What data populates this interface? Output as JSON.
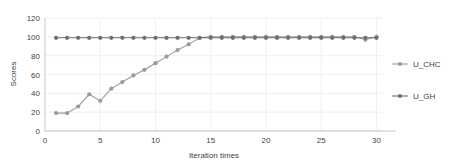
{
  "chart_data": {
    "type": "line",
    "title": "",
    "xlabel": "Iteration times",
    "ylabel": "Scores",
    "xlim": [
      0,
      30.5
    ],
    "ylim": [
      0,
      120
    ],
    "xticks": [
      0,
      5,
      10,
      15,
      20,
      25,
      30
    ],
    "yticks": [
      0,
      20,
      40,
      60,
      80,
      100,
      120
    ],
    "grid": true,
    "legend_position": "right",
    "x": [
      1,
      2,
      3,
      4,
      5,
      6,
      7,
      8,
      9,
      10,
      11,
      12,
      13,
      14,
      15,
      16,
      17,
      18,
      19,
      20,
      21,
      22,
      23,
      24,
      25,
      26,
      27,
      28,
      29,
      30
    ],
    "series": [
      {
        "name": "U_CHC",
        "color": "#9a9a9a",
        "marker": "circle",
        "values": [
          19,
          19,
          26,
          39,
          32,
          45,
          52,
          59,
          65,
          72,
          79,
          86,
          92,
          99,
          100,
          100,
          100,
          100,
          100,
          100,
          100,
          100,
          100,
          100,
          100,
          100,
          100,
          100,
          97,
          100
        ]
      },
      {
        "name": "U_GH",
        "color": "#6e6e6e",
        "marker": "circle",
        "values": [
          99,
          99,
          99,
          99,
          99,
          99,
          99,
          99,
          99,
          99,
          99,
          99,
          99,
          99,
          99,
          99,
          99,
          99,
          99,
          99,
          99,
          99,
          99,
          99,
          99,
          99,
          99,
          99,
          99,
          99
        ]
      }
    ]
  },
  "legend": {
    "items": [
      {
        "label": "U_CHC"
      },
      {
        "label": "U_GH"
      }
    ]
  },
  "axes": {
    "y_label": "Scores",
    "x_label": "Iteration times",
    "y_tick_labels": [
      "0",
      "20",
      "40",
      "60",
      "80",
      "100",
      "120"
    ],
    "x_tick_labels": [
      "0",
      "5",
      "10",
      "15",
      "20",
      "25",
      "30"
    ]
  },
  "colors": {
    "u_chc": "#9a9a9a",
    "u_gh": "#6e6e6e",
    "grid": "#e8e8e8",
    "axis": "#b0b0b0",
    "text": "#3f3f3f",
    "background": "#ffffff"
  }
}
